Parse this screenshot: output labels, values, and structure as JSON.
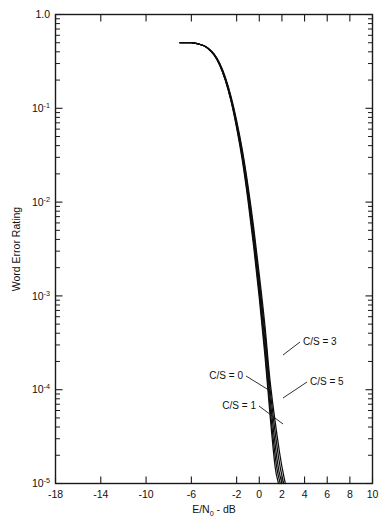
{
  "chart_data": {
    "type": "line",
    "title": "",
    "xlabel": "E/N₀ - dB",
    "ylabel": "Word Error Rating",
    "xlim": [
      -18,
      10
    ],
    "ylim": [
      1e-05,
      1.0
    ],
    "yscale": "log",
    "xscale": "linear",
    "grid": false,
    "legend_position": "inline-annotations",
    "xticks": [
      -18,
      -14,
      -10,
      -6,
      -2,
      0,
      2,
      4,
      6,
      8,
      10
    ],
    "xtick_labels": [
      "-18",
      "-14",
      "-10",
      "-6",
      "-2",
      "0",
      "2",
      "4",
      "6",
      "8",
      "10"
    ],
    "yticks": [
      1.0,
      0.1,
      0.01,
      0.001,
      0.0001,
      1e-05
    ],
    "ytick_labels": [
      "1.0",
      "10⁻¹",
      "10⁻²",
      "10⁻³",
      "10⁻⁴",
      "10⁻⁵"
    ],
    "ytick_mantissas": [
      "1.0",
      "10",
      "10",
      "10",
      "10",
      "10"
    ],
    "ytick_exponents": [
      "",
      "-1",
      "-2",
      "-3",
      "-4",
      "-5"
    ],
    "series": [
      {
        "name": "C/S = 0",
        "label": "C/S = 0",
        "x": [
          -7.0,
          -6.0,
          -5.0,
          -4.5,
          -4.0,
          -3.5,
          -3.0,
          -2.5,
          -2.0,
          -1.5,
          -1.0,
          -0.5,
          0.0,
          0.5,
          1.0,
          1.4,
          1.7
        ],
        "y": [
          0.5,
          0.5,
          0.47,
          0.43,
          0.37,
          0.29,
          0.2,
          0.12,
          0.062,
          0.028,
          0.0105,
          0.0034,
          0.00095,
          0.00023,
          4.6e-05,
          1.5e-05,
          1e-05
        ]
      },
      {
        "name": "C/S = 1",
        "label": "C/S = 1",
        "x": [
          -7.0,
          -6.0,
          -5.0,
          -4.5,
          -4.0,
          -3.5,
          -3.0,
          -2.5,
          -2.0,
          -1.5,
          -1.0,
          -0.5,
          0.0,
          0.5,
          1.0,
          1.5,
          1.85
        ],
        "y": [
          0.5,
          0.5,
          0.47,
          0.43,
          0.37,
          0.29,
          0.2,
          0.122,
          0.064,
          0.03,
          0.0115,
          0.0038,
          0.00108,
          0.00027,
          5.6e-05,
          1.6e-05,
          1e-05
        ]
      },
      {
        "name": "C/S = 3",
        "label": "C/S = 3",
        "x": [
          -7.0,
          -6.0,
          -5.0,
          -4.5,
          -4.0,
          -3.5,
          -3.0,
          -2.5,
          -2.0,
          -1.5,
          -1.0,
          -0.5,
          0.0,
          0.5,
          1.0,
          1.6,
          2.0
        ],
        "y": [
          0.5,
          0.5,
          0.47,
          0.43,
          0.375,
          0.295,
          0.205,
          0.126,
          0.067,
          0.032,
          0.0127,
          0.0043,
          0.00125,
          0.00033,
          7.2e-05,
          1.7e-05,
          1e-05
        ]
      },
      {
        "name": "C/S = 5",
        "label": "C/S = 5",
        "x": [
          -7.0,
          -6.0,
          -5.0,
          -4.5,
          -4.0,
          -3.5,
          -3.0,
          -2.5,
          -2.0,
          -1.5,
          -1.0,
          -0.5,
          0.0,
          0.5,
          1.0,
          1.7,
          2.15
        ],
        "y": [
          0.5,
          0.5,
          0.47,
          0.435,
          0.378,
          0.3,
          0.21,
          0.13,
          0.07,
          0.034,
          0.0138,
          0.0048,
          0.00145,
          0.0004,
          9e-05,
          1.9e-05,
          1e-05
        ]
      },
      {
        "name": "curve-5",
        "label": "",
        "x": [
          -7.0,
          -6.0,
          -5.0,
          -4.5,
          -4.0,
          -3.5,
          -3.0,
          -2.5,
          -2.0,
          -1.5,
          -1.0,
          -0.5,
          0.0,
          0.5,
          1.0,
          1.8,
          2.3
        ],
        "y": [
          0.5,
          0.5,
          0.47,
          0.437,
          0.38,
          0.302,
          0.214,
          0.134,
          0.074,
          0.036,
          0.015,
          0.0054,
          0.00168,
          0.00048,
          0.00011,
          2.1e-05,
          1e-05
        ]
      }
    ],
    "annotations": [
      {
        "text": "C/S = 3",
        "text_x": 303,
        "text_y": 345,
        "anchor": "start",
        "leader": [
          [
            300,
            342
          ],
          [
            283,
            355
          ]
        ]
      },
      {
        "text": "C/S = 0",
        "text_x": 243,
        "text_y": 379,
        "anchor": "end",
        "leader": [
          [
            246,
            376
          ],
          [
            272,
            392
          ]
        ]
      },
      {
        "text": "C/S = 5",
        "text_x": 310,
        "text_y": 385,
        "anchor": "start",
        "leader": [
          [
            307,
            382
          ],
          [
            283,
            398
          ]
        ]
      },
      {
        "text": "C/S = 1",
        "text_x": 256,
        "text_y": 409,
        "anchor": "end",
        "leader": [
          [
            259,
            406
          ],
          [
            283,
            424
          ]
        ]
      }
    ]
  }
}
